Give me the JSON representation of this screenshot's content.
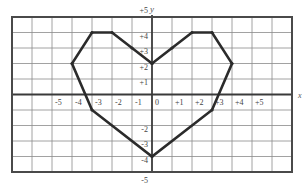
{
  "chart_data": {
    "type": "line",
    "title": "",
    "xlabel": "x",
    "ylabel": "y",
    "xlim": [
      -7,
      7
    ],
    "ylim": [
      -5,
      5
    ],
    "grid": true,
    "x_tick_labels": [
      "-5",
      "-4",
      "-3",
      "-2",
      "-1",
      "0",
      "+1",
      "+2",
      "+3",
      "+4",
      "+5"
    ],
    "x_tick_values": [
      -5,
      -4,
      -3,
      -2,
      -1,
      0,
      1,
      2,
      3,
      4,
      5
    ],
    "y_tick_labels": [
      "+5",
      "+4",
      "+3",
      "+2",
      "+1",
      "-2",
      "-3",
      "-4",
      "-5"
    ],
    "y_tick_values": [
      5,
      4,
      3,
      2,
      1,
      -2,
      -3,
      -4,
      -5
    ],
    "series": [
      {
        "name": "heart",
        "closed": true,
        "points": [
          [
            0,
            2
          ],
          [
            -1,
            3
          ],
          [
            -2,
            4
          ],
          [
            -3,
            4
          ],
          [
            -4,
            2
          ],
          [
            -3,
            -1
          ],
          [
            0,
            -4
          ],
          [
            3,
            -1
          ],
          [
            4,
            2
          ],
          [
            3,
            4
          ],
          [
            2,
            4
          ],
          [
            1,
            3
          ],
          [
            0,
            2
          ]
        ],
        "color": "#2b2b2b"
      }
    ]
  },
  "style": {
    "grid_color": "#8a8a8a",
    "axis_color": "#3a3a3a",
    "border_color": "#4a4a4a",
    "shape_color": "#2b2b2b",
    "label_color": "#444444"
  }
}
